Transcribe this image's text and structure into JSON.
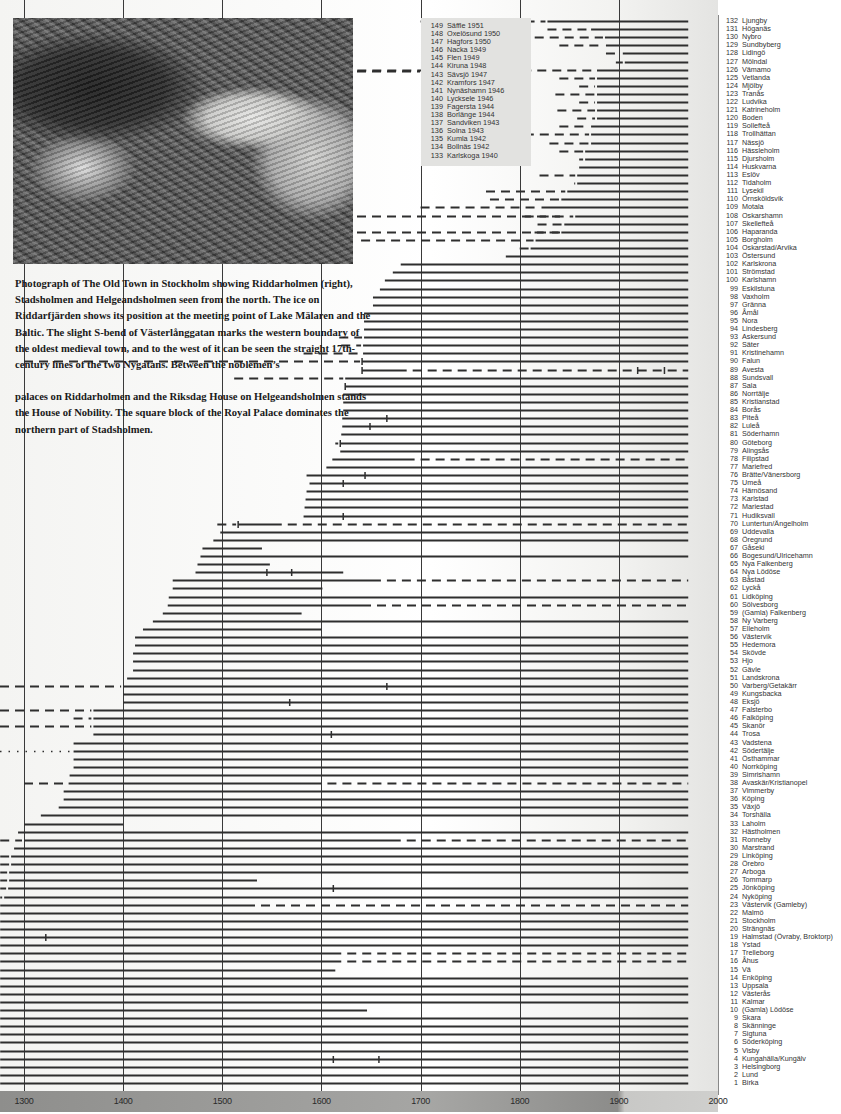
{
  "caption": {
    "p1": "Photograph of The Old Town in Stockholm showing Riddarholmen (right), Stadsholmen and Helgeandsholmen seen from the north. The ice on Riddarfjärden shows its position at the meeting point of Lake Mälaren and the Baltic. The slight S-bend of Västerlånggatan marks the western boundary of the oldest medieval town, and to the west of it can be seen the straight 17th-century lines of the two Nygatans. Between the noblemen’s",
    "p2": "palaces on Riddarholmen and the Riksdag House on Helgeandsholmen stands the House of Nobility. The square block of the Royal Palace dominates the northern part of Stadsholmen."
  },
  "photo": {
    "subject": "aerial-photo-old-town-stockholm"
  },
  "chart_data": {
    "type": "timeline",
    "title": "",
    "xlabel": "",
    "ylabel": "",
    "x_ticks": [
      1300,
      1400,
      1500,
      1600,
      1700,
      1800,
      1900,
      2000
    ],
    "xlim": [
      1276,
      2000
    ],
    "grid": true,
    "legend_position": "inset top-center (towns 133–149) and right column (towns 1–132)",
    "end_year": 1970,
    "inset_towns": [
      {
        "n": 149,
        "name": "Säffle",
        "year": 1951
      },
      {
        "n": 148,
        "name": "Oxelösund",
        "year": 1950
      },
      {
        "n": 147,
        "name": "Hagfors",
        "year": 1950
      },
      {
        "n": 146,
        "name": "Nacka",
        "year": 1949
      },
      {
        "n": 145,
        "name": "Flen",
        "year": 1949
      },
      {
        "n": 144,
        "name": "Kiruna",
        "year": 1948
      },
      {
        "n": 143,
        "name": "Sävsjö",
        "year": 1947
      },
      {
        "n": 142,
        "name": "Kramfors",
        "year": 1947
      },
      {
        "n": 141,
        "name": "Nynäshamn",
        "year": 1946
      },
      {
        "n": 140,
        "name": "Lycksele",
        "year": 1946
      },
      {
        "n": 139,
        "name": "Fagersta",
        "year": 1944
      },
      {
        "n": 138,
        "name": "Borlänge",
        "year": 1944
      },
      {
        "n": 137,
        "name": "Sandviken",
        "year": 1943
      },
      {
        "n": 136,
        "name": "Solna",
        "year": 1943
      },
      {
        "n": 135,
        "name": "Kumla",
        "year": 1942
      },
      {
        "n": 134,
        "name": "Bollnäs",
        "year": 1942
      },
      {
        "n": 133,
        "name": "Karlskoga",
        "year": 1940
      }
    ],
    "towns": [
      {
        "n": 132,
        "name": "Ljungby",
        "start": 1828,
        "dashed_from": 1700
      },
      {
        "n": 131,
        "name": "Höganäs",
        "start": 1872,
        "dashed_from": 1828
      },
      {
        "n": 130,
        "name": "Nybro",
        "start": 1886,
        "dashed_from": 1800
      },
      {
        "n": 129,
        "name": "Sundbyberg",
        "start": 1887,
        "dashed_from": 1840
      },
      {
        "n": 128,
        "name": "Lidingö",
        "start": 1904,
        "dashed_from": 1887
      },
      {
        "n": 127,
        "name": "Mölndal",
        "start": 1906,
        "dashed_from": 1897
      },
      {
        "n": 126,
        "name": "Vämamo",
        "start": 1878,
        "dashed_from": 1500
      },
      {
        "n": 125,
        "name": "Vetlanda",
        "start": 1878,
        "dashed_from": 1840
      },
      {
        "n": 124,
        "name": "Mjölby",
        "start": 1878,
        "dashed_from": 1860
      },
      {
        "n": 123,
        "name": "Tranås",
        "start": 1878,
        "dashed_from": 1836
      },
      {
        "n": 122,
        "name": "Ludvika",
        "start": 1878,
        "dashed_from": 1860
      },
      {
        "n": 121,
        "name": "Katrineholm",
        "start": 1878,
        "dashed_from": 1838
      },
      {
        "n": 120,
        "name": "Boden",
        "start": 1878,
        "dashed_from": 1858
      },
      {
        "n": 119,
        "name": "Sollefteå",
        "start": 1872,
        "dashed_from": 1840
      },
      {
        "n": 118,
        "name": "Trollhättan",
        "start": 1872,
        "dashed_from": 1790
      },
      {
        "n": 117,
        "name": "Nässjö",
        "start": 1872,
        "dashed_from": 1830
      },
      {
        "n": 116,
        "name": "Hässleholm",
        "start": 1866,
        "dashed_from": 1840
      },
      {
        "n": 115,
        "name": "Djursholm",
        "start": 1866,
        "dashed_from": 1860
      },
      {
        "n": 114,
        "name": "Huskvarna",
        "start": 1860,
        "dashed_from": 1858
      },
      {
        "n": 113,
        "name": "Eslöv",
        "start": 1858,
        "dashed_from": 1820
      },
      {
        "n": 112,
        "name": "Tidaholm",
        "start": 1858,
        "dashed_from": 1855
      },
      {
        "n": 111,
        "name": "Lysekil",
        "start": 1848,
        "dashed_from": 1766
      },
      {
        "n": 110,
        "name": "Örnsköldsvik",
        "start": 1842,
        "dashed_from": 1770
      },
      {
        "n": 109,
        "name": "Motala",
        "start": 1822,
        "dashed_from": 1700
      },
      {
        "n": 108,
        "name": "Oskarshamn",
        "start": 1856,
        "dashed_from": 1805
      },
      {
        "n": 107,
        "name": "Skellefteå",
        "start": 1845,
        "dashed_from": 1818
      },
      {
        "n": 106,
        "name": "Haparanda",
        "start": 1842,
        "dashed_from": 1815
      },
      {
        "n": 105,
        "name": "Borgholm",
        "start": 1816,
        "dashed_from": 1640
      },
      {
        "n": 104,
        "name": "Oskarstad/Arvika",
        "start": 1811,
        "dashed_from": 1800
      },
      {
        "n": 103,
        "name": "Östersund",
        "start": 1786,
        "dashed_from": null
      },
      {
        "n": 102,
        "name": "Karlskrona",
        "start": 1680,
        "dashed_from": null
      },
      {
        "n": 101,
        "name": "Strömstad",
        "start": 1672,
        "dashed_from": 1670
      },
      {
        "n": 100,
        "name": "Karlshamn",
        "start": 1664,
        "dashed_from": null
      },
      {
        "n": 99,
        "name": "Eskilstuna",
        "start": 1659,
        "dashed_from": null
      },
      {
        "n": 98,
        "name": "Vaxholm",
        "start": 1652,
        "dashed_from": null
      },
      {
        "n": 97,
        "name": "Gränna",
        "start": 1652,
        "dashed_from": null
      },
      {
        "n": 96,
        "name": "Åmål",
        "start": 1643,
        "dashed_from": null
      },
      {
        "n": 95,
        "name": "Nora",
        "start": 1643,
        "dashed_from": null
      },
      {
        "n": 94,
        "name": "Lindesberg",
        "start": 1643,
        "dashed_from": null
      },
      {
        "n": 93,
        "name": "Askersund",
        "start": 1643,
        "dashed_from": 1618
      },
      {
        "n": 92,
        "name": "Säter",
        "start": 1642,
        "dashed_from": 1620
      },
      {
        "n": 91,
        "name": "Kristinehamn",
        "start": 1642,
        "dashed_from": 1582
      },
      {
        "n": 90,
        "name": "Falun",
        "start": 1641,
        "dashed_from": 1300,
        "ticks": [
          1641
        ]
      },
      {
        "n": 89,
        "name": "Avesta",
        "start": 1641,
        "dashed_from": null,
        "dashed_after": 1686,
        "ticks": [
          1641,
          1919,
          1946
        ]
      },
      {
        "n": 88,
        "name": "Sundsvall",
        "start": 1624,
        "dashed_from": 1512
      },
      {
        "n": 87,
        "name": "Sala",
        "start": 1624,
        "dashed_from": null,
        "ticks": [
          1624
        ]
      },
      {
        "n": 86,
        "name": "Norrtälje",
        "start": 1622,
        "dashed_from": null
      },
      {
        "n": 85,
        "name": "Kristianstad",
        "start": 1622,
        "dashed_from": null
      },
      {
        "n": 84,
        "name": "Borås",
        "start": 1622,
        "dashed_from": null
      },
      {
        "n": 83,
        "name": "Piteå",
        "start": 1621,
        "dashed_from": null,
        "ticks": [
          1666
        ]
      },
      {
        "n": 82,
        "name": "Luleå",
        "start": 1621,
        "dashed_from": null,
        "ticks": [
          1649
        ]
      },
      {
        "n": 81,
        "name": "Söderhamn",
        "start": 1620,
        "dashed_from": null
      },
      {
        "n": 80,
        "name": "Göteborg",
        "start": 1619,
        "dashed_from": 1614,
        "ticks": [
          1619
        ]
      },
      {
        "n": 79,
        "name": "Alingsås",
        "start": 1619,
        "dashed_from": null
      },
      {
        "n": 78,
        "name": "Filipstad",
        "start": 1611,
        "dashed_from": null,
        "dashed_after": 1694
      },
      {
        "n": 77,
        "name": "Mariefred",
        "start": 1605,
        "dashed_from": null
      },
      {
        "n": 76,
        "name": "Brätte/Vänersborg",
        "start": 1585,
        "dashed_from": null,
        "ticks": [
          1644
        ]
      },
      {
        "n": 75,
        "name": "Umeå",
        "start": 1588,
        "dashed_from": null,
        "ticks": [
          1622
        ]
      },
      {
        "n": 74,
        "name": "Härnösand",
        "start": 1585,
        "dashed_from": null
      },
      {
        "n": 73,
        "name": "Karlstad",
        "start": 1584,
        "dashed_from": null
      },
      {
        "n": 72,
        "name": "Mariestad",
        "start": 1583,
        "dashed_from": null
      },
      {
        "n": 71,
        "name": "Hudiksvall",
        "start": 1582,
        "dashed_from": null,
        "ticks": [
          1622
        ]
      },
      {
        "n": 70,
        "name": "Luntertun/Ängelholm",
        "start": 1516,
        "dashed_from": 1495,
        "dashed_after": 1560,
        "ticks": [
          1516
        ]
      },
      {
        "n": 69,
        "name": "Uddevalla",
        "start": 1498,
        "dashed_from": null
      },
      {
        "n": 68,
        "name": "Öregrund",
        "start": 1491,
        "dashed_from": null
      },
      {
        "n": 67,
        "name": "Gåseki",
        "start": 1480,
        "dashed_from": null,
        "end": 1540
      },
      {
        "n": 66,
        "name": "Bogesund/Ulricehamn",
        "start": 1478,
        "dashed_from": null
      },
      {
        "n": 65,
        "name": "Nya Falkenberg",
        "start": 1475,
        "dashed_from": null,
        "end": 1548
      },
      {
        "n": 64,
        "name": "Nya Lödöse",
        "start": 1473,
        "dashed_from": null,
        "end": 1622,
        "ticks": [
          1545,
          1570
        ]
      },
      {
        "n": 63,
        "name": "Båstad",
        "start": 1450,
        "dashed_from": null,
        "dashed_after": 1660
      },
      {
        "n": 62,
        "name": "Lyckå",
        "start": 1450,
        "dashed_from": null,
        "end": 1601
      },
      {
        "n": 61,
        "name": "Lidköping",
        "start": 1446,
        "dashed_from": null
      },
      {
        "n": 60,
        "name": "Sölvesborg",
        "start": 1445,
        "dashed_from": null,
        "dashed_after": 1650
      },
      {
        "n": 59,
        "name": "(Gamla) Falkenberg",
        "start": 1440,
        "dashed_from": null,
        "end": 1580
      },
      {
        "n": 58,
        "name": "Ny Varberg",
        "start": 1430,
        "dashed_from": null
      },
      {
        "n": 57,
        "name": "Elleholm",
        "start": 1420,
        "dashed_from": null,
        "end": 1600
      },
      {
        "n": 56,
        "name": "Västervik",
        "start": 1412,
        "dashed_from": null
      },
      {
        "n": 55,
        "name": "Hedemora",
        "start": 1412,
        "dashed_from": null
      },
      {
        "n": 54,
        "name": "Skövde",
        "start": 1410,
        "dashed_from": null
      },
      {
        "n": 53,
        "name": "Hjo",
        "start": 1410,
        "dashed_from": null
      },
      {
        "n": 52,
        "name": "Gävle",
        "start": 1410,
        "dashed_from": null
      },
      {
        "n": 51,
        "name": "Landskrona",
        "start": 1404,
        "dashed_from": null
      },
      {
        "n": 50,
        "name": "Varberg/Getakärr",
        "start": 1400,
        "dashed_from": 1270,
        "ticks": [
          1666
        ]
      },
      {
        "n": 49,
        "name": "Kungsbacka",
        "start": 1400,
        "dashed_from": null
      },
      {
        "n": 48,
        "name": "Eksjö",
        "start": 1400,
        "dashed_from": null,
        "ticks": [
          1568
        ]
      },
      {
        "n": 47,
        "name": "Falsterbo",
        "start": 1370,
        "dashed_from": 1270
      },
      {
        "n": 46,
        "name": "Falköping",
        "start": 1370,
        "dashed_from": 1350
      },
      {
        "n": 45,
        "name": "Skanör",
        "start": 1370,
        "dashed_from": 1270
      },
      {
        "n": 44,
        "name": "Trosa",
        "start": 1370,
        "dashed_from": null,
        "ticks": [
          1610
        ]
      },
      {
        "n": 43,
        "name": "Vadstena",
        "start": 1350,
        "dashed_from": null
      },
      {
        "n": 42,
        "name": "Södertälje",
        "start": 1350,
        "dashed_from": 1270,
        "dotted": true
      },
      {
        "n": 41,
        "name": "Östhammar",
        "start": 1350,
        "dashed_from": null
      },
      {
        "n": 40,
        "name": "Norrköping",
        "start": 1350,
        "dashed_from": null
      },
      {
        "n": 39,
        "name": "Simrishamn",
        "start": 1346,
        "dashed_from": null
      },
      {
        "n": 38,
        "name": "Avaskär/Kristianopel",
        "start": 1345,
        "dashed_from": 1300,
        "dashed_after": 1600
      },
      {
        "n": 37,
        "name": "Vimmerby",
        "start": 1340,
        "dashed_from": null
      },
      {
        "n": 36,
        "name": "Köping",
        "start": 1340,
        "dashed_from": null
      },
      {
        "n": 35,
        "name": "Växjö",
        "start": 1335,
        "dashed_from": null
      },
      {
        "n": 34,
        "name": "Torshälla",
        "start": 1317,
        "dashed_from": null
      },
      {
        "n": 33,
        "name": "Laholm",
        "start": 1300,
        "dashed_from": null,
        "end": 1400
      },
      {
        "n": 32,
        "name": "Hästholmen",
        "start": 1294,
        "dashed_from": null
      },
      {
        "n": 31,
        "name": "Ronneby",
        "start": 1300,
        "dashed_from": 1276,
        "dashed_after": 1680
      },
      {
        "n": 30,
        "name": "Marstrand",
        "start": 1290,
        "dashed_from": null
      },
      {
        "n": 29,
        "name": "Linköping",
        "start": 1287,
        "dashed_from": 1276
      },
      {
        "n": 28,
        "name": "Örebro",
        "start": 1287,
        "dashed_from": 1276
      },
      {
        "n": 27,
        "name": "Arboga",
        "start": 1285,
        "dashed_from": 1276
      },
      {
        "n": 26,
        "name": "Tommarp",
        "start": 1285,
        "dashed_from": 1276,
        "end": 1535
      },
      {
        "n": 25,
        "name": "Jönköping",
        "start": 1284,
        "dashed_from": 1276,
        "ticks": [
          1612
        ]
      },
      {
        "n": 24,
        "name": "Nyköping",
        "start": 1280,
        "dashed_from": 1276
      },
      {
        "n": 23,
        "name": "Västervik (Gamleby)",
        "start": 1276,
        "dashed_from": null,
        "dashed_after": 1533
      },
      {
        "n": 22,
        "name": "Malmö",
        "start": 1276,
        "dashed_from": null
      },
      {
        "n": 21,
        "name": "Stockholm",
        "start": 1276,
        "dashed_from": null
      },
      {
        "n": 20,
        "name": "Strängnäs",
        "start": 1276,
        "dashed_from": null
      },
      {
        "n": 19,
        "name": "Halmstad (Övraby, Broktorp)",
        "start": 1276,
        "dashed_from": null,
        "ticks": [
          1322
        ]
      },
      {
        "n": 18,
        "name": "Ystad",
        "start": 1276,
        "dashed_from": null
      },
      {
        "n": 17,
        "name": "Trelleborg",
        "start": 1276,
        "dashed_from": null,
        "dashed_after": 1620
      },
      {
        "n": 16,
        "name": "Åhus",
        "start": 1276,
        "dashed_from": null,
        "dashed_after": 1620
      },
      {
        "n": 15,
        "name": "Vä",
        "start": 1276,
        "dashed_from": null,
        "end": 1614
      },
      {
        "n": 14,
        "name": "Enköping",
        "start": 1276,
        "dashed_from": null
      },
      {
        "n": 13,
        "name": "Uppsala",
        "start": 1276,
        "dashed_from": null
      },
      {
        "n": 12,
        "name": "Västerås",
        "start": 1276,
        "dashed_from": null
      },
      {
        "n": 11,
        "name": "Kalmar",
        "start": 1276,
        "dashed_from": null
      },
      {
        "n": 10,
        "name": "(Gamla) Lödöse",
        "start": 1276,
        "dashed_from": null,
        "end": 1646
      },
      {
        "n": 9,
        "name": "Skara",
        "start": 1276,
        "dashed_from": null
      },
      {
        "n": 8,
        "name": "Skänninge",
        "start": 1276,
        "dashed_from": null
      },
      {
        "n": 7,
        "name": "Sigtuna",
        "start": 1276,
        "dashed_from": null
      },
      {
        "n": 6,
        "name": "Söderköping",
        "start": 1276,
        "dashed_from": null
      },
      {
        "n": 5,
        "name": "Visby",
        "start": 1276,
        "dashed_from": null
      },
      {
        "n": 4,
        "name": "Kungahälla/Kungälv",
        "start": 1276,
        "dashed_from": null,
        "ticks": [
          1612,
          1658
        ]
      },
      {
        "n": 3,
        "name": "Helsingborg",
        "start": 1276,
        "dashed_from": null
      },
      {
        "n": 2,
        "name": "Lund",
        "start": 1276,
        "dashed_from": null
      },
      {
        "n": 1,
        "name": "Birka",
        "start": 1276,
        "dashed_from": null
      }
    ]
  }
}
